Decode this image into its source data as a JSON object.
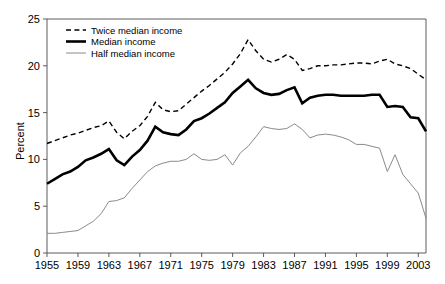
{
  "chart_data": {
    "type": "line",
    "title": "",
    "xlabel": "",
    "ylabel": "Percent",
    "xlim": [
      1955,
      2004
    ],
    "ylim": [
      0,
      25
    ],
    "ytick_step": 5,
    "yticks": [
      "0",
      "5",
      "10",
      "15",
      "20",
      "25"
    ],
    "xticks": [
      "1955",
      "1959",
      "1963",
      "1967",
      "1971",
      "1975",
      "1979",
      "1983",
      "1987",
      "1991",
      "1995",
      "1999",
      "2003"
    ],
    "grid": false,
    "legend_position": "top-left",
    "x": [
      1955,
      1956,
      1957,
      1958,
      1959,
      1960,
      1961,
      1962,
      1963,
      1964,
      1965,
      1966,
      1967,
      1968,
      1969,
      1970,
      1971,
      1972,
      1973,
      1974,
      1975,
      1976,
      1977,
      1978,
      1979,
      1980,
      1981,
      1982,
      1983,
      1984,
      1985,
      1986,
      1987,
      1988,
      1989,
      1990,
      1991,
      1992,
      1993,
      1994,
      1995,
      1996,
      1997,
      1998,
      1999,
      2000,
      2001,
      2002,
      2003,
      2004
    ],
    "series": [
      {
        "name": "Twice median income",
        "style": "dashed",
        "color": "#000000",
        "width": 1.4,
        "values": [
          11.7,
          12.0,
          12.3,
          12.6,
          12.8,
          13.1,
          13.4,
          13.6,
          14.1,
          12.9,
          12.2,
          13.0,
          13.6,
          14.6,
          16.1,
          15.3,
          15.1,
          15.2,
          15.9,
          16.6,
          17.3,
          17.9,
          18.6,
          19.3,
          20.2,
          21.3,
          22.8,
          21.6,
          20.7,
          20.4,
          20.7,
          21.2,
          20.7,
          19.5,
          19.7,
          20.0,
          20.0,
          20.1,
          20.1,
          20.2,
          20.3,
          20.3,
          20.2,
          20.5,
          20.7,
          20.2,
          20.0,
          19.7,
          19.1,
          18.5
        ]
      },
      {
        "name": "Median income",
        "style": "solid",
        "color": "#000000",
        "width": 2.6,
        "values": [
          7.4,
          7.9,
          8.4,
          8.7,
          9.2,
          9.9,
          10.2,
          10.6,
          11.1,
          9.9,
          9.4,
          10.3,
          11.0,
          12.0,
          13.5,
          12.9,
          12.7,
          12.6,
          13.2,
          14.1,
          14.4,
          14.9,
          15.5,
          16.1,
          17.1,
          17.8,
          18.5,
          17.6,
          17.1,
          16.9,
          17.0,
          17.4,
          17.7,
          16.0,
          16.6,
          16.8,
          16.9,
          16.9,
          16.8,
          16.8,
          16.8,
          16.8,
          16.9,
          16.9,
          15.6,
          15.7,
          15.6,
          14.5,
          14.4,
          13.0
        ]
      },
      {
        "name": "Half median income",
        "style": "solid",
        "color": "#8a8a8a",
        "width": 1.0,
        "values": [
          2.1,
          2.1,
          2.2,
          2.3,
          2.4,
          2.9,
          3.4,
          4.2,
          5.5,
          5.6,
          5.9,
          6.9,
          7.8,
          8.7,
          9.3,
          9.6,
          9.8,
          9.8,
          10.0,
          10.6,
          10.0,
          9.9,
          10.0,
          10.5,
          9.4,
          10.7,
          11.4,
          12.4,
          13.5,
          13.3,
          13.2,
          13.3,
          13.8,
          13.2,
          12.3,
          12.6,
          12.7,
          12.6,
          12.4,
          12.1,
          11.6,
          11.6,
          11.4,
          11.2,
          8.7,
          10.5,
          8.4,
          7.4,
          6.4,
          3.7
        ]
      }
    ]
  },
  "legend": {
    "items": [
      {
        "label": "Twice median income",
        "style": "dashed"
      },
      {
        "label": "Median income",
        "style": "thick"
      },
      {
        "label": "Half median income",
        "style": "thin"
      }
    ]
  }
}
